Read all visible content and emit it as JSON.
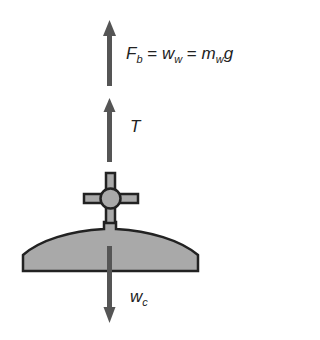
{
  "diagram": {
    "colors": {
      "arrow": "#555555",
      "fill": "#a9a9a9",
      "outline": "#222222"
    },
    "forces": [
      {
        "id": "buoyant",
        "label_main": "F",
        "label_sub": "b",
        "equation": "F_b = w_w = m_w g",
        "direction": "up"
      },
      {
        "id": "tension",
        "label_main": "T",
        "direction": "up"
      },
      {
        "id": "weight",
        "label_main": "w",
        "label_sub": "c",
        "direction": "down"
      }
    ],
    "buoyant_label": {
      "f": "F",
      "f_sub": "b",
      "eq1": " = ",
      "w": "w",
      "w_sub": "w",
      "eq2": " = ",
      "m": "m",
      "m_sub": "w",
      "g": "g"
    },
    "tension_label": "T",
    "weight_label": {
      "w": "w",
      "w_sub": "c"
    }
  }
}
